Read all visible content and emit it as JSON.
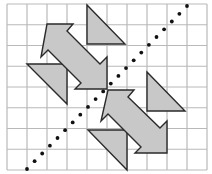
{
  "figure": {
    "grid": {
      "columns": 10,
      "rows": 8,
      "origin_px": [
        7,
        4
      ],
      "cell_width_px": 20,
      "cell_height_px": 20.75,
      "line_color": "#b9b9b9"
    },
    "colors": {
      "shape_fill": "#c8c8c8",
      "shape_stroke": "#2a2a2a",
      "dot_color": "#111111",
      "background": "#ffffff"
    },
    "dotted_line": {
      "start_px": [
        27,
        169
      ],
      "end_px": [
        187,
        6
      ],
      "dot_count": 22
    },
    "shapes": [
      {
        "name": "triangle-top-right",
        "points": "87,5 87,44 125,44"
      },
      {
        "name": "triangle-left",
        "points": "27,64 67,64 67,104"
      },
      {
        "name": "triangle-right",
        "points": "147,72 147,111 185,111"
      },
      {
        "name": "triangle-bottom",
        "points": "88,130 127,130 127,170"
      },
      {
        "name": "arrow-upper",
        "points": "47,24 73,24 67,31 100,64 107,57 107,89 75,89 81,83 48,50 41,57"
      },
      {
        "name": "arrow-lower",
        "points": "108,90 134,90 128,97 160,128 167,121 167,153 135,153 141,147 108,114 101,121"
      }
    ]
  }
}
